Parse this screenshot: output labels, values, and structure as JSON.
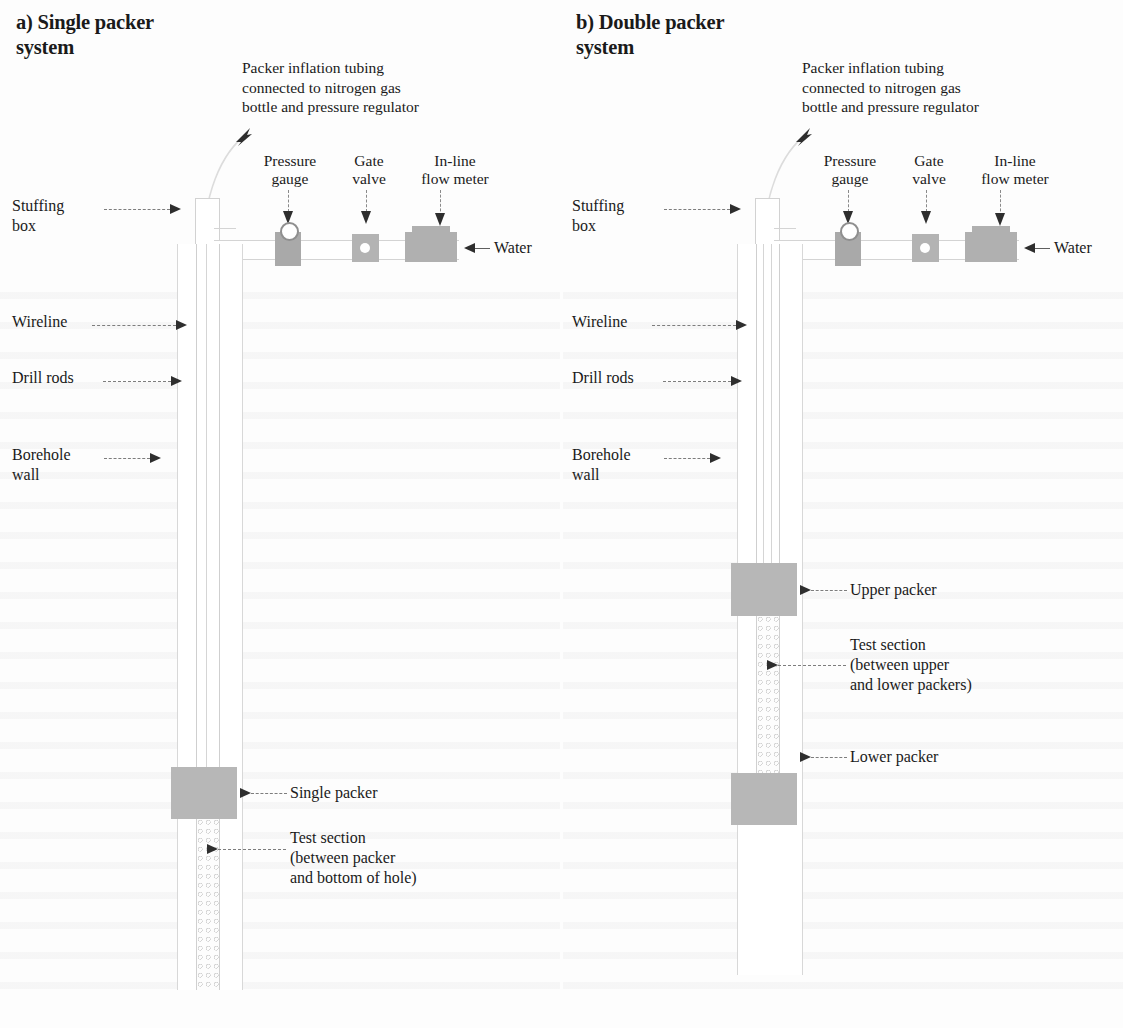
{
  "figure": {
    "type": "technical-diagram"
  },
  "panels": [
    {
      "id": "a",
      "title": "a) Single packer\n    system",
      "header_note": "Packer inflation tubing\nconnected to nitrogen gas\nbottle and pressure regulator",
      "instruments": [
        {
          "name": "pressure-gauge",
          "label": "Pressure\ngauge"
        },
        {
          "name": "gate-valve",
          "label": "Gate\nvalve"
        },
        {
          "name": "flow-meter",
          "label": "In-line\nflow meter"
        }
      ],
      "water_label": "Water",
      "left_labels": [
        {
          "name": "stuffing-box",
          "label": "Stuffing\nbox"
        },
        {
          "name": "wireline",
          "label": "Wireline"
        },
        {
          "name": "drill-rods",
          "label": "Drill rods"
        },
        {
          "name": "borehole-wall",
          "label": "Borehole\nwall"
        }
      ],
      "callouts": [
        {
          "name": "single-packer",
          "label": "Single packer"
        },
        {
          "name": "test-section",
          "label": "Test section\n(between packer\nand bottom of hole)"
        }
      ]
    },
    {
      "id": "b",
      "title": "b) Double packer\n    system",
      "header_note": "Packer inflation tubing\nconnected to nitrogen gas\nbottle and pressure regulator",
      "instruments": [
        {
          "name": "pressure-gauge",
          "label": "Pressure\ngauge"
        },
        {
          "name": "gate-valve",
          "label": "Gate\nvalve"
        },
        {
          "name": "flow-meter",
          "label": "In-line\nflow meter"
        }
      ],
      "water_label": "Water",
      "left_labels": [
        {
          "name": "stuffing-box",
          "label": "Stuffing\nbox"
        },
        {
          "name": "wireline",
          "label": "Wireline"
        },
        {
          "name": "drill-rods",
          "label": "Drill rods"
        },
        {
          "name": "borehole-wall",
          "label": "Borehole\nwall"
        }
      ],
      "callouts": [
        {
          "name": "upper-packer",
          "label": "Upper packer"
        },
        {
          "name": "test-section",
          "label": "Test section\n(between upper\nand lower packers)"
        },
        {
          "name": "lower-packer",
          "label": "Lower packer"
        }
      ]
    }
  ],
  "colors": {
    "packer_fill": "#b7b7b7",
    "instrument_fill": "#a9a9a9",
    "line": "#d4d4d4",
    "arrow": "#2e2e2e",
    "page_background": "#fdfdfd",
    "text": "#1a1a1a"
  }
}
